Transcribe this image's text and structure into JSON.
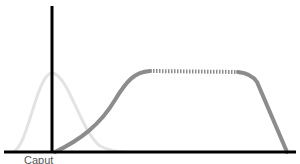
{
  "diagram": {
    "colors": {
      "axis": "#000000",
      "bell_curve": "#e3e3e3",
      "plateau_curve": "#8c8c8c",
      "label": "#555555"
    },
    "axis_label": "Caput",
    "curves": [
      {
        "name": "bell-curve",
        "style": "solid",
        "color": "#e3e3e3"
      },
      {
        "name": "plateau-curve",
        "style": "solid with dotted plateau",
        "color": "#8c8c8c"
      }
    ]
  }
}
